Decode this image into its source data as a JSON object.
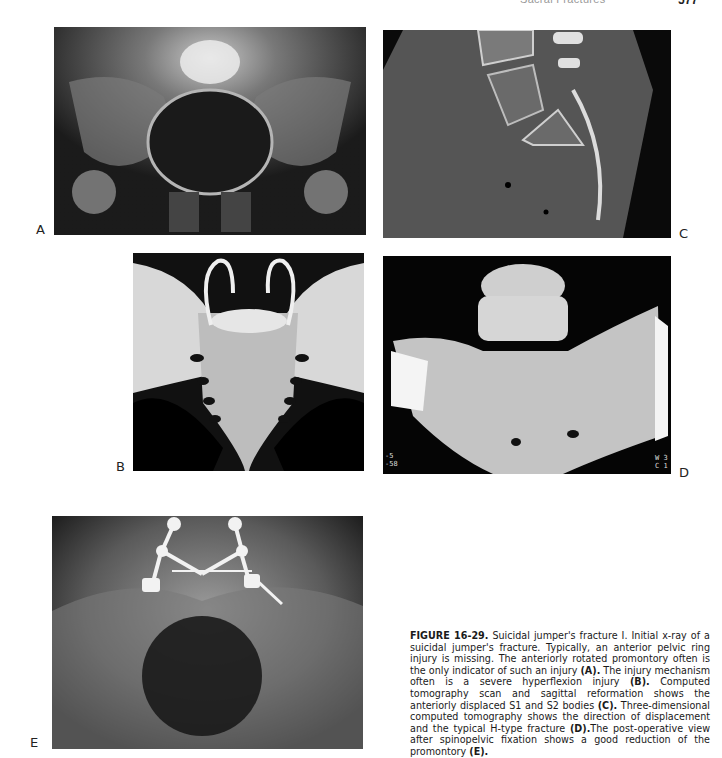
{
  "running_head": {
    "title": "Sacral Fractures",
    "page_number": "577"
  },
  "figure": {
    "panels": [
      {
        "label": "A",
        "description": "Initial AP pelvis x-ray of suicidal jumper's fracture"
      },
      {
        "label": "B",
        "description": "Illustration of sacrum showing hyperflexion injury mechanism"
      },
      {
        "label": "C",
        "description": "CT sagittal reformation showing displaced S1 and S2 bodies"
      },
      {
        "label": "D",
        "description": "3D CT reconstruction of sacrum showing H-type fracture"
      },
      {
        "label": "E",
        "description": "Postoperative x-ray after spinopelvic fixation"
      }
    ],
    "ct_annotations_left": [
      "-5",
      "-58",
      "",
      "15",
      "77"
    ],
    "ct_annotations_right": [
      "W 3",
      "C 1"
    ],
    "caption": {
      "number": "FIGURE 16-29.",
      "segments": [
        {
          "text": " Suicidal jumper's fracture I. Initial x-ray of a suicidal jumper's fracture. Typically, an anterior pelvic ring injury is missing. The anteriorly rotated promontory often is the only indicator of such an injury ",
          "bold": false
        },
        {
          "text": "(A).",
          "bold": true
        },
        {
          "text": " The injury mechanism often is a severe hyperflexion injury ",
          "bold": false
        },
        {
          "text": "(B).",
          "bold": true
        },
        {
          "text": " Computed tomography scan and sagittal reformation shows the anteriorly displaced S1 and S2 bodies ",
          "bold": false
        },
        {
          "text": "(C).",
          "bold": true
        },
        {
          "text": " Three-dimensional computed tomography shows the direction of displacement and the typical H-type fracture ",
          "bold": false
        },
        {
          "text": "(D).",
          "bold": true
        },
        {
          "text": "The post-operative view after spinopelvic fixation shows a good reduction of the promontory ",
          "bold": false
        },
        {
          "text": "(E).",
          "bold": true
        }
      ]
    }
  }
}
